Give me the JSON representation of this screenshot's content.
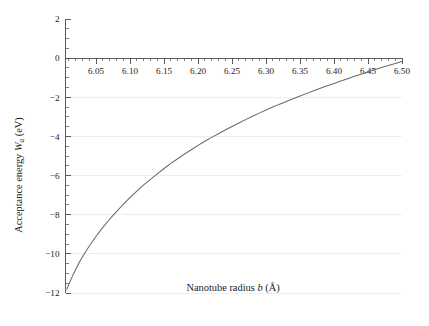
{
  "chart_data": {
    "type": "line",
    "title": "",
    "xlabel": "Nanotube radius b (Å)",
    "xlabel_parts": {
      "pre": "Nanotube radius ",
      "italic": "b",
      "post": " (Å)"
    },
    "ylabel": "Acceptance energy W_a (eV)",
    "ylabel_parts": {
      "pre": "Acceptance energy ",
      "italic": "W",
      "sub": "a",
      "post": " (eV)"
    },
    "xlim": [
      6.005,
      6.5
    ],
    "ylim": [
      -12,
      2
    ],
    "xticks": [
      6.05,
      6.1,
      6.15,
      6.2,
      6.25,
      6.3,
      6.35,
      6.4,
      6.45,
      6.5
    ],
    "xtick_labels": [
      "6.05",
      "6.10",
      "6.15",
      "6.20",
      "6.25",
      "6.30",
      "6.35",
      "6.40",
      "6.45",
      "6.50"
    ],
    "xtick_minor_step": 0.01,
    "yticks": [
      2,
      0,
      -2,
      -4,
      -6,
      -8,
      -10,
      -12
    ],
    "ytick_labels": [
      "2",
      "0",
      "-2",
      "-4",
      "-6",
      "-8",
      "-10",
      "-12"
    ],
    "ytick_minor_step": 0.5,
    "grid": {
      "horizontal": true,
      "vertical": false,
      "color": "#e9eaee"
    },
    "legend": null,
    "axis_position": {
      "x_axis_at_y": 0,
      "y_axis_at_x": 6.005
    },
    "zero_crossing_x": 6.335,
    "series": [
      {
        "name": "Acceptance energy",
        "color": "#6a6a6a",
        "x": [
          6.007,
          6.01,
          6.015,
          6.02,
          6.025,
          6.03,
          6.04,
          6.05,
          6.06,
          6.07,
          6.08,
          6.09,
          6.1,
          6.11,
          6.12,
          6.13,
          6.14,
          6.15,
          6.16,
          6.17,
          6.18,
          6.19,
          6.2,
          6.21,
          6.22,
          6.23,
          6.24,
          6.25,
          6.26,
          6.27,
          6.28,
          6.29,
          6.3,
          6.31,
          6.32,
          6.33,
          6.335,
          6.34,
          6.35,
          6.36,
          6.37,
          6.38,
          6.39,
          6.4,
          6.41,
          6.42,
          6.43,
          6.44,
          6.45,
          6.46,
          6.47,
          6.48,
          6.49,
          6.5
        ],
        "y": [
          -11.8,
          -11.55,
          -11.15,
          -10.8,
          -10.45,
          -10.15,
          -9.6,
          -9.1,
          -8.65,
          -8.23,
          -7.84,
          -7.47,
          -7.12,
          -6.79,
          -6.48,
          -6.19,
          -5.91,
          -5.64,
          -5.38,
          -5.14,
          -4.9,
          -4.68,
          -4.46,
          -4.25,
          -4.05,
          -3.86,
          -3.67,
          -3.49,
          -3.31,
          -3.14,
          -2.97,
          -2.81,
          -2.65,
          -2.5,
          -2.35,
          -2.21,
          -2.14,
          -2.07,
          -1.93,
          -1.8,
          -1.67,
          -1.54,
          -1.41,
          -1.29,
          -1.17,
          -1.05,
          -0.93,
          -0.82,
          -0.7,
          -0.59,
          -0.48,
          -0.38,
          -0.27,
          -0.17
        ]
      }
    ]
  }
}
